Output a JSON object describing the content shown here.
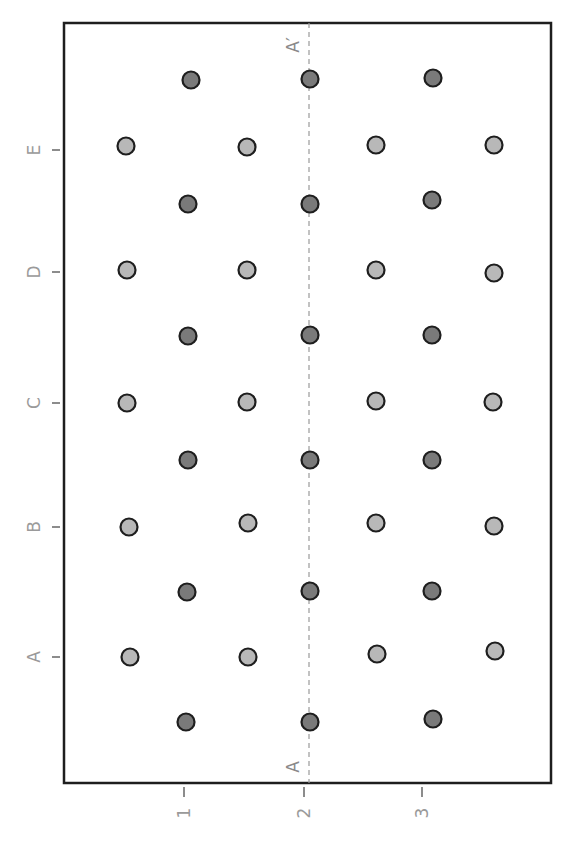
{
  "diagram": {
    "frame": {
      "x": 64,
      "y": 23,
      "width": 487,
      "height": 760
    },
    "colors": {
      "frame": "#1e1e1e",
      "dark_fill": "#7a7a7a",
      "light_fill": "#b8b8b8",
      "circle_stroke": "#1e1e1e",
      "tick": "#8c8c8c",
      "label": "#9a9a9a",
      "section_line": "#9a9a9a"
    },
    "x_axis": {
      "ticks": [
        {
          "label": "1",
          "x": 184
        },
        {
          "label": "2",
          "x": 304
        },
        {
          "label": "3",
          "x": 422
        }
      ]
    },
    "y_axis": {
      "ticks": [
        {
          "label": "E",
          "y": 150
        },
        {
          "label": "D",
          "y": 272
        },
        {
          "label": "C",
          "y": 403
        },
        {
          "label": "B",
          "y": 527
        },
        {
          "label": "A",
          "y": 657
        }
      ]
    },
    "section_line": {
      "x": 309,
      "start_label": "A",
      "end_label": "A′"
    },
    "dark_circles": [
      [
        191,
        80
      ],
      [
        310,
        79
      ],
      [
        433,
        78
      ],
      [
        188,
        204
      ],
      [
        310,
        204
      ],
      [
        432,
        200
      ],
      [
        188,
        336
      ],
      [
        310,
        335
      ],
      [
        432,
        335
      ],
      [
        188,
        460
      ],
      [
        310,
        460
      ],
      [
        432,
        460
      ],
      [
        187,
        592
      ],
      [
        310,
        591
      ],
      [
        432,
        591
      ],
      [
        186,
        722
      ],
      [
        310,
        722
      ],
      [
        433,
        719
      ]
    ],
    "light_circles": [
      [
        126,
        146
      ],
      [
        247,
        147
      ],
      [
        376,
        145
      ],
      [
        494,
        145
      ],
      [
        127,
        270
      ],
      [
        247,
        270
      ],
      [
        376,
        270
      ],
      [
        494,
        273
      ],
      [
        127,
        403
      ],
      [
        247,
        402
      ],
      [
        376,
        401
      ],
      [
        493,
        402
      ],
      [
        129,
        527
      ],
      [
        248,
        523
      ],
      [
        376,
        523
      ],
      [
        494,
        526
      ],
      [
        130,
        657
      ],
      [
        248,
        657
      ],
      [
        377,
        654
      ],
      [
        495,
        651
      ]
    ],
    "circle_radius": 8.5
  }
}
